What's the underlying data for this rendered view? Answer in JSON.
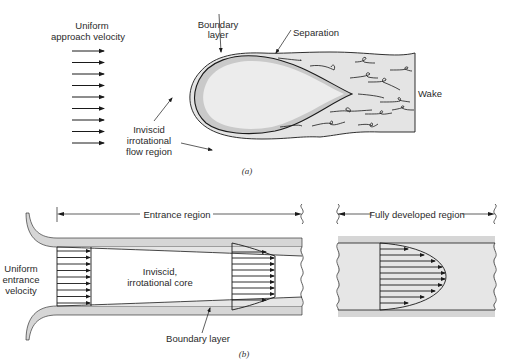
{
  "panel_a": {
    "caption": "(a)",
    "labels": {
      "approach_1": "Uniform",
      "approach_2": "approach velocity",
      "boundary_1": "Boundary",
      "boundary_2": "layer",
      "separation": "Separation",
      "wake": "Wake",
      "inviscid_1": "Inviscid",
      "inviscid_2": "irrotational",
      "inviscid_3": "flow region"
    }
  },
  "panel_b": {
    "caption": "(b)",
    "labels": {
      "entrance_region": "Entrance region",
      "fully_developed": "Fully developed region",
      "uniform_1": "Uniform",
      "uniform_2": "entrance",
      "uniform_3": "velocity",
      "core_1": "Inviscid,",
      "core_2": "irrotational core",
      "boundary_layer": "Boundary layer"
    }
  },
  "colors": {
    "shade": "#e2e2e2",
    "shade_dark": "#cfcfcf",
    "line": "#1a1a1a"
  }
}
